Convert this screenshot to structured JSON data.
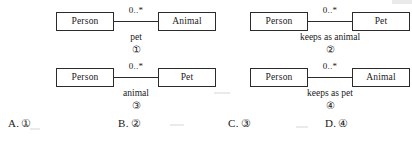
{
  "diagrams": [
    {
      "position": "top-left",
      "left_class": "Person",
      "right_class": "Animal",
      "multiplicity": "0..*",
      "role_label": "pet",
      "number": "①"
    },
    {
      "position": "top-right",
      "left_class": "Person",
      "right_class": "Pet",
      "multiplicity": "0..*",
      "role_label": "keeps as animal",
      "number": "②"
    },
    {
      "position": "bottom-left",
      "left_class": "Person",
      "right_class": "Pet",
      "multiplicity": "0..*",
      "role_label": "animal",
      "number": "③"
    },
    {
      "position": "bottom-right",
      "left_class": "Person",
      "right_class": "Animal",
      "multiplicity": "0..*",
      "role_label": "keeps as pet",
      "number": "④"
    }
  ],
  "options": [
    {
      "letter": "A.",
      "value": "①"
    },
    {
      "letter": "B.",
      "value": "②"
    },
    {
      "letter": "C.",
      "value": "③"
    },
    {
      "letter": "D.",
      "value": "④"
    }
  ],
  "colors": {
    "ink": "#1a1a1a",
    "line": "#2b2b2b",
    "page": "#ffffff"
  }
}
